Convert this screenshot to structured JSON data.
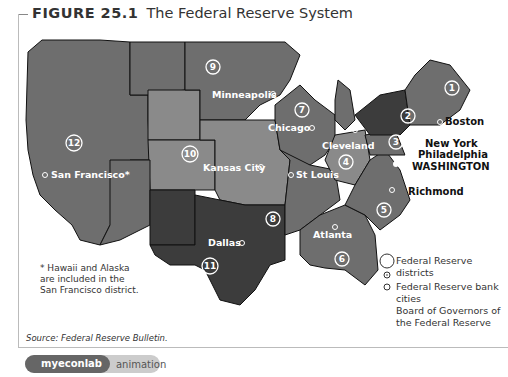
{
  "figure": {
    "number": "FIGURE 25.1",
    "title": "The Federal Reserve System"
  },
  "districts": [
    {
      "id": "1",
      "label": "1",
      "city": "Boston"
    },
    {
      "id": "2",
      "label": "2",
      "city": "New York"
    },
    {
      "id": "3",
      "label": "3",
      "city": "Philadelphia"
    },
    {
      "id": "4",
      "label": "4",
      "city": "Cleveland"
    },
    {
      "id": "5",
      "label": "5",
      "city": "Richmond"
    },
    {
      "id": "6",
      "label": "6",
      "city": "Atlanta"
    },
    {
      "id": "7",
      "label": "7",
      "city": "Chicago"
    },
    {
      "id": "8",
      "label": "8",
      "city": "St Louis"
    },
    {
      "id": "9",
      "label": "9",
      "city": "Minneapolis"
    },
    {
      "id": "10",
      "label": "10",
      "city": "Kansas City"
    },
    {
      "id": "11",
      "label": "11",
      "city": "Dallas"
    },
    {
      "id": "12",
      "label": "12",
      "city": "San Francisco*"
    }
  ],
  "capital": "WASHINGTON",
  "note": "* Hawaii and Alaska are included in the San Francisco district.",
  "legend": {
    "districts": "Federal Reserve districts",
    "bank_cities": "Federal Reserve bank cities",
    "board": "Board of Governors of the Federal Reserve"
  },
  "source": "Source: Federal Reserve Bulletin.",
  "badge": {
    "logo": "myeconlab",
    "label": "animation"
  },
  "colors": {
    "district_mid": "#6e6e6e",
    "district_light": "#8a8a8a",
    "district_dark": "#3c3c3c",
    "border": "#111111",
    "label_white": "#ffffff"
  }
}
